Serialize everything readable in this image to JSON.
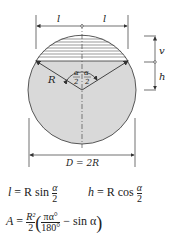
{
  "diagram": {
    "type": "circular-segment",
    "labels": {
      "half_chord_left": "l",
      "half_chord_right": "l",
      "segment_height": "v",
      "apex_distance": "h",
      "radius": "R",
      "half_angle_num": "α",
      "half_angle_den": "2",
      "diameter": "D = 2R"
    },
    "colors": {
      "fill": "#d9d9d9",
      "line": "#333333",
      "hatch": "#555555"
    }
  },
  "formulas": {
    "l_lhs": "l",
    "l_eq": " = R sin ",
    "l_frac_num": "α",
    "l_frac_den": "2",
    "h_lhs": "h",
    "h_eq": " = R cos ",
    "h_frac_num": "α",
    "h_frac_den": "2",
    "A_lhs": "A",
    "A_eq": " = ",
    "A_frac_num": "R²",
    "A_frac_den": "2",
    "A_inner_num": "πα°",
    "A_inner_den": "180°",
    "A_tail": " − sin α"
  }
}
